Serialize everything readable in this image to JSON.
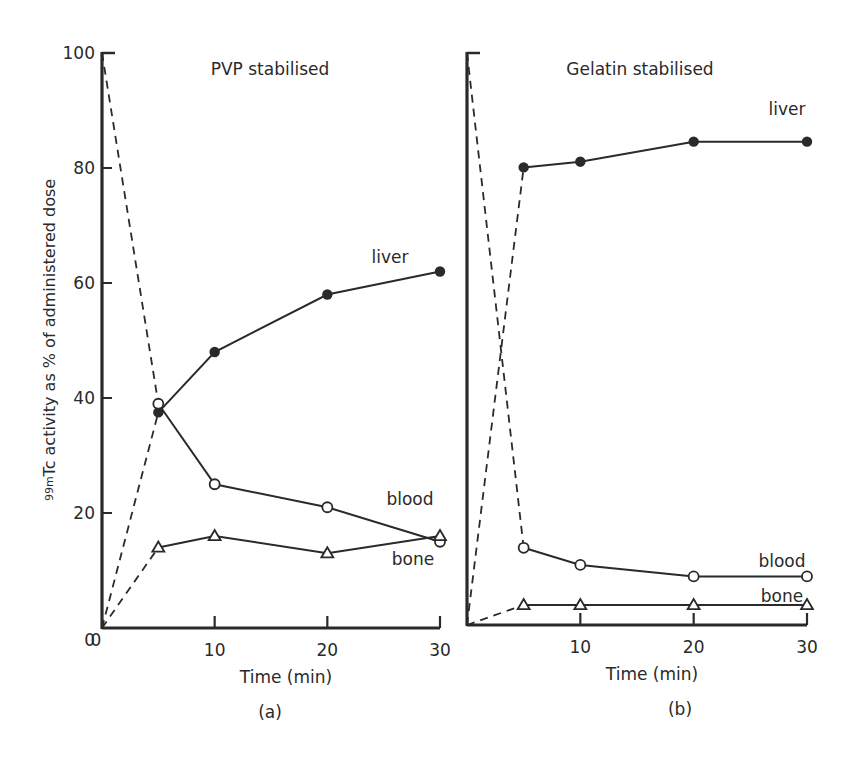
{
  "figure": {
    "y_axis_label_sup": "99m",
    "y_axis_label": "Tc activity as % of administered dose"
  },
  "chart_data": [
    {
      "type": "line",
      "panel": "(a)",
      "title": "PVP stabilised",
      "xlabel": "Time (min)",
      "ylabel": "99mTc activity as % of administered dose",
      "xlim": [
        0,
        30
      ],
      "ylim": [
        0,
        100
      ],
      "x_ticks": [
        "0",
        "10",
        "20",
        "30"
      ],
      "y_ticks": [
        "0",
        "20",
        "40",
        "60",
        "80",
        "100"
      ],
      "grid": false,
      "x": [
        5,
        10,
        20,
        30
      ],
      "series": [
        {
          "name": "liver",
          "marker": "filled-circle",
          "values": [
            37.5,
            48,
            58,
            62
          ],
          "dashed_from": [
            0,
            0
          ]
        },
        {
          "name": "blood",
          "marker": "open-circle",
          "values": [
            39,
            25,
            21,
            15
          ],
          "dashed_from": [
            0,
            100
          ]
        },
        {
          "name": "bone",
          "marker": "open-triangle",
          "values": [
            14,
            16,
            13,
            16
          ],
          "dashed_from": [
            0,
            0
          ]
        }
      ]
    },
    {
      "type": "line",
      "panel": "(b)",
      "title": "Gelatin stabilised",
      "xlabel": "Time (min)",
      "ylabel": "99mTc activity as % of administered dose",
      "xlim": [
        0,
        30
      ],
      "ylim": [
        0,
        100
      ],
      "x_ticks": [
        "10",
        "20",
        "30"
      ],
      "grid": false,
      "x": [
        5,
        10,
        20,
        30
      ],
      "series": [
        {
          "name": "liver",
          "marker": "filled-circle",
          "values": [
            80,
            81,
            84.5,
            84.5
          ],
          "dashed_from": [
            0,
            0
          ]
        },
        {
          "name": "blood",
          "marker": "open-circle",
          "values": [
            13.5,
            10.5,
            8.5,
            8.5
          ],
          "dashed_from": [
            0,
            100
          ]
        },
        {
          "name": "bone",
          "marker": "open-triangle",
          "values": [
            3.5,
            3.5,
            3.5,
            3.5
          ],
          "dashed_from": [
            0,
            0
          ]
        }
      ]
    }
  ],
  "panels": {
    "a": {
      "title": "PVP stabilised",
      "xlabel": "Time (min)",
      "caption": "(a)",
      "labels": {
        "liver": "liver",
        "blood": "blood",
        "bone": "bone"
      },
      "yticks": [
        "0",
        "20",
        "40",
        "60",
        "80",
        "100"
      ],
      "xticks": [
        "10",
        "20",
        "30"
      ]
    },
    "b": {
      "title": "Gelatin stabilised",
      "xlabel": "Time (min)",
      "caption": "(b)",
      "labels": {
        "liver": "liver",
        "blood": "blood",
        "bone": "bone"
      },
      "xticks": [
        "10",
        "20",
        "30"
      ]
    }
  }
}
